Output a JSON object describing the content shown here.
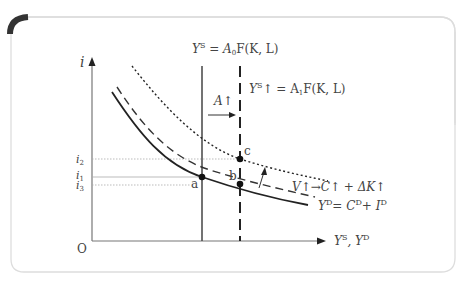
{
  "axes": {
    "y_label": "i",
    "x_label": "Y",
    "x_label_sup1": "S",
    "x_label_mid": ", Y",
    "x_label_sup2": "D",
    "origin": "O"
  },
  "ticks": {
    "i2": {
      "base": "i",
      "sub": "2"
    },
    "i1": {
      "base": "i",
      "sub": "1"
    },
    "i3": {
      "base": "i",
      "sub": "3"
    }
  },
  "labels": {
    "ys0": {
      "a": "Y",
      "sup": "S",
      "b": " = A",
      "sub": "0",
      "c": "F(K, L)"
    },
    "ys1": {
      "a": "Y",
      "sup": "S",
      "b": "↑ = A",
      "sub": "1",
      "c": "F(K, L)"
    },
    "shift": "A↑",
    "yd": {
      "a": "Y",
      "sup": "D",
      "b": "= C",
      "sup2": "D",
      "c": "+ I",
      "sup3": "D"
    },
    "v": "V↑→C↑ + ΔK↑"
  },
  "points": {
    "a": "a",
    "b": "b",
    "c": "c"
  },
  "colors": {
    "curve": "#222222",
    "axis": "#777777",
    "text": "#444444",
    "frame": "#dddddd",
    "corner": "#333333"
  }
}
